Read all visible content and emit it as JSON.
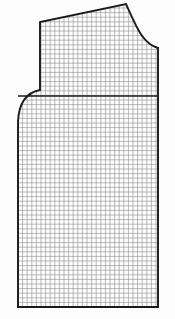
{
  "canvas": {
    "width": 175,
    "height": 319,
    "background_color": "#fdfdfd",
    "title": "Garment Pattern Piece on Graph Paper"
  },
  "graph_paper": {
    "name": "grid-graph-paper",
    "cell_size_px": 4.6,
    "line_color": "#8d8d8d",
    "line_width": 0.6,
    "columns": 30,
    "rows": 46,
    "clipped_to_outline": true
  },
  "outline": {
    "name": "pattern-outline",
    "stroke_color": "#1a1a1a",
    "stroke_width": 1.9,
    "fill": "none",
    "vertices": {
      "bottom_left": [
        18,
        307
      ],
      "underarm_left": [
        18,
        122
      ],
      "armhole_top": [
        40,
        90
      ],
      "shoulder_inner": [
        40,
        22
      ],
      "shoulder_tip": [
        126,
        4
      ],
      "neck_base": [
        158,
        48
      ],
      "bottom_right": [
        158,
        307
      ]
    },
    "curves": {
      "armhole": {
        "name": "armhole-curve",
        "start": [
          40,
          90
        ],
        "control": [
          19,
          94
        ],
        "end": [
          18,
          122
        ]
      },
      "neckline": {
        "name": "neckline-curve",
        "start": [
          126,
          4
        ],
        "control1": [
          136,
          26
        ],
        "control2": [
          142,
          43
        ],
        "end": [
          158,
          48
        ]
      }
    }
  },
  "guide_lines": [
    {
      "name": "chest-line",
      "orientation": "horizontal",
      "y": 96,
      "x_start": 18,
      "x_end": 158,
      "stroke_color": "#1a1a1a",
      "stroke_width": 1.6
    }
  ],
  "legend": {
    "piece_label": "",
    "notes": ""
  }
}
